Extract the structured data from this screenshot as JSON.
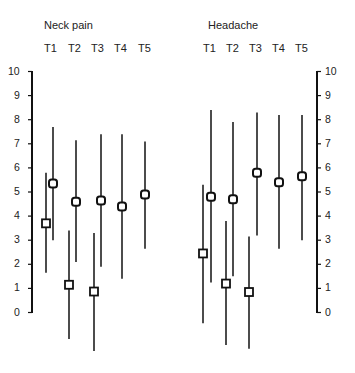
{
  "chart_data": {
    "type": "error-bar",
    "panels": [
      {
        "title": "Neck pain",
        "categories": [
          "T1",
          "T2",
          "T3",
          "T4",
          "T5"
        ],
        "series": [
          {
            "name": "square",
            "marker": "square",
            "points": [
              {
                "x": "T1",
                "y": 3.7,
                "low": 1.65,
                "high": 5.8
              },
              {
                "x": "T2",
                "y": 1.15,
                "low": -1.1,
                "high": 3.4
              },
              {
                "x": "T3",
                "y": 0.87,
                "low": -1.6,
                "high": 3.3
              }
            ]
          },
          {
            "name": "circle",
            "marker": "circle",
            "points": [
              {
                "x": "T1",
                "y": 5.35,
                "low": 3.0,
                "high": 7.7
              },
              {
                "x": "T2",
                "y": 4.6,
                "low": 2.1,
                "high": 7.15
              },
              {
                "x": "T3",
                "y": 4.65,
                "low": 1.9,
                "high": 7.4
              },
              {
                "x": "T4",
                "y": 4.4,
                "low": 1.4,
                "high": 7.4
              },
              {
                "x": "T5",
                "y": 4.9,
                "low": 2.65,
                "high": 7.1
              }
            ]
          }
        ]
      },
      {
        "title": "Headache",
        "categories": [
          "T1",
          "T2",
          "T3",
          "T4",
          "T5"
        ],
        "series": [
          {
            "name": "square",
            "marker": "square",
            "points": [
              {
                "x": "T1",
                "y": 2.45,
                "low": -0.45,
                "high": 5.3
              },
              {
                "x": "T2",
                "y": 1.2,
                "low": -1.35,
                "high": 3.8
              },
              {
                "x": "T3",
                "y": 0.85,
                "low": -1.5,
                "high": 3.15
              }
            ]
          },
          {
            "name": "circle",
            "marker": "circle",
            "points": [
              {
                "x": "T1",
                "y": 4.8,
                "low": 1.25,
                "high": 8.4
              },
              {
                "x": "T2",
                "y": 4.7,
                "low": 1.5,
                "high": 7.9
              },
              {
                "x": "T3",
                "y": 5.8,
                "low": 3.2,
                "high": 8.3
              },
              {
                "x": "T4",
                "y": 5.4,
                "low": 2.65,
                "high": 8.2
              },
              {
                "x": "T5",
                "y": 5.65,
                "low": 3.0,
                "high": 8.2
              }
            ]
          }
        ]
      }
    ],
    "yticks": [
      0,
      1,
      2,
      3,
      4,
      5,
      6,
      7,
      8,
      9,
      10
    ],
    "ylim": [
      0,
      10
    ],
    "xlabel": "",
    "ylabel": "",
    "grid": false,
    "legend": null
  }
}
